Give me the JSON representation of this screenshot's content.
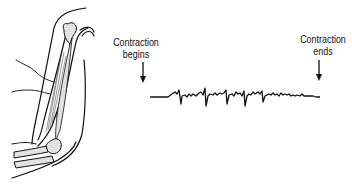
{
  "figure": {
    "arm_illustration": "arm-muscle-illustration",
    "labels": {
      "begin": [
        "Contraction",
        "begins"
      ],
      "end": [
        "Contraction",
        "ends"
      ]
    },
    "colors": {
      "line": "#111111",
      "stipple": "#bdbdbd",
      "background": "#ffffff"
    }
  }
}
